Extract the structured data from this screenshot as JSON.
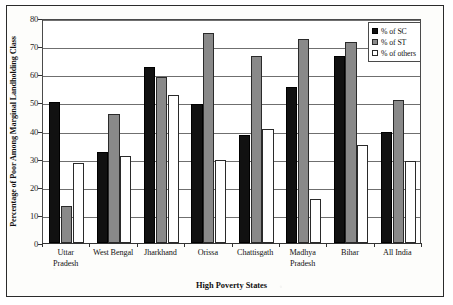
{
  "chart_data": {
    "type": "bar",
    "title": "",
    "xlabel": "High Poverty States",
    "ylabel": "Percentage of Poor Among Marginal Landholding Class",
    "categories": [
      "Uttar Pradesh",
      "West Bengal",
      "Jharkhand",
      "Orissa",
      "Chattisgath",
      "Madhya Pradesh",
      "Bihar",
      "All India"
    ],
    "category_lines": [
      [
        "Uttar",
        "Pradesh"
      ],
      [
        "West Bengal"
      ],
      [
        "Jharkhand"
      ],
      [
        "Orissa"
      ],
      [
        "Chattisgath"
      ],
      [
        "Madhya",
        "Pradesh"
      ],
      [
        "Bihar"
      ],
      [
        "All India"
      ]
    ],
    "series": [
      {
        "name": "% of SC",
        "color": "#111111",
        "values": [
          50.2,
          32.5,
          62.6,
          49.5,
          38.5,
          55.5,
          66.5,
          39.5
        ]
      },
      {
        "name": "% of ST",
        "color": "#898989",
        "values": [
          13.0,
          46.0,
          59.2,
          74.7,
          66.5,
          72.5,
          71.5,
          51.0
        ]
      },
      {
        "name": "% of others",
        "color": "#ffffff",
        "values": [
          28.6,
          31.0,
          52.6,
          29.6,
          40.5,
          15.5,
          35.0,
          29.0
        ]
      }
    ],
    "ylim": [
      0,
      80
    ],
    "yticks": [
      0,
      10,
      20,
      30,
      40,
      50,
      60,
      70,
      80
    ],
    "ytick_labels": [
      "0",
      "10",
      "20",
      "30",
      "40",
      "50",
      "60",
      "70",
      "80"
    ],
    "grid": true,
    "grid_axis": "y",
    "legend_position": "top-right",
    "legend": [
      "% of SC",
      "% of ST",
      "% of others"
    ]
  }
}
